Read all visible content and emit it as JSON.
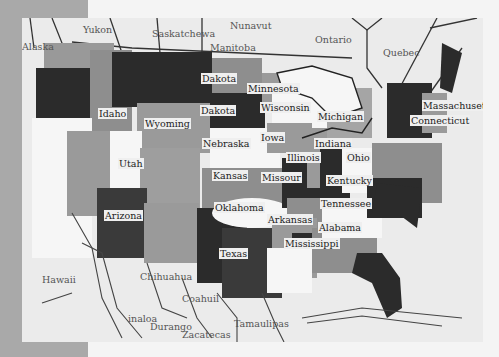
{
  "artwork": {
    "subject": "painted map of the United States",
    "palette": {
      "frame": "#a9a9a9",
      "paper": "#ebebeb",
      "dark": "#2b2b2b",
      "mid": "#8e8e8e",
      "light": "#bdbdbd",
      "white": "#f6f6f6"
    },
    "labels": {
      "alaska": "Alaska",
      "yukon": "Yukon",
      "saskatchewan": "Saskatchewa",
      "nunavut": "Nunavut",
      "manitoba": "Manitoba",
      "ontario": "Ontario",
      "quebec": "Quebec",
      "north_dakota": "Dakota",
      "south_dakota": "Dakota",
      "minnesota": "Minnesota",
      "idaho": "Idaho",
      "wyoming": "Wyoming",
      "wisconsin": "Wisconsin",
      "michigan": "Michigan",
      "massachusetts": "Massachusett",
      "connecticut": "Connecticut",
      "nebraska": "Nebraska",
      "iowa": "Iowa",
      "illinois": "Illinois",
      "indiana": "Indiana",
      "ohio": "Ohio",
      "utah": "Utah",
      "kansas": "Kansas",
      "missouri": "Missour",
      "kentucky": "Kentucky",
      "tennessee": "Tennessee",
      "oklahoma": "Oklahoma",
      "arkansas": "Arkansas",
      "arizona": "Arizona",
      "alabama": "Alabama",
      "mississippi": "Mississippi",
      "texas": "Texas",
      "hawaii": "Hawaii",
      "chihuahua": "Chihuahua",
      "coahuila": "Coahuil",
      "sinaloa": "inaloa",
      "durango": "Durango",
      "zacatecas": "Zacatecas",
      "tamaulipas": "Tamaulipas"
    }
  }
}
